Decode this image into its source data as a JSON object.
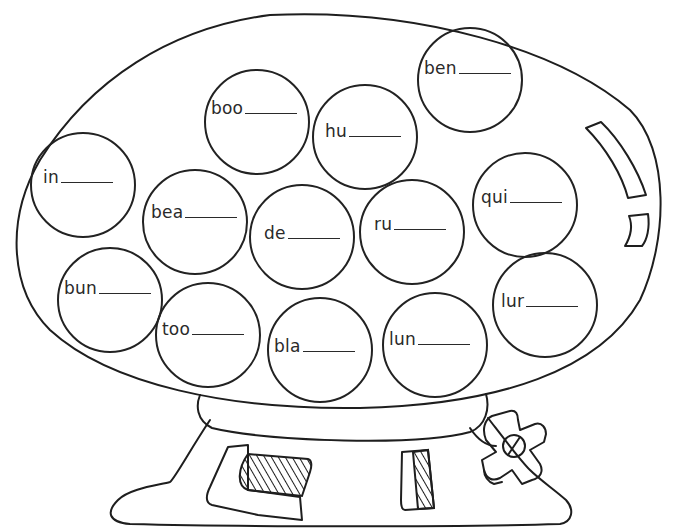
{
  "worksheet": {
    "header_partial": "",
    "illustration": "gumball machine",
    "blank_marker": "_____",
    "bubbles": [
      {
        "id": "in",
        "prefix": "in",
        "cx": 83,
        "cy": 185,
        "tx": -40,
        "ty": -8
      },
      {
        "id": "boo",
        "prefix": "boo",
        "cx": 257,
        "cy": 122,
        "tx": -46,
        "ty": -14
      },
      {
        "id": "hu",
        "prefix": "hu",
        "cx": 365,
        "cy": 137,
        "tx": -40,
        "ty": -6
      },
      {
        "id": "ben",
        "prefix": "ben",
        "cx": 470,
        "cy": 80,
        "tx": -46,
        "ty": -12
      },
      {
        "id": "qui",
        "prefix": "qui",
        "cx": 525,
        "cy": 205,
        "tx": -44,
        "ty": -8
      },
      {
        "id": "bea",
        "prefix": "bea",
        "cx": 195,
        "cy": 222,
        "tx": -44,
        "ty": -10
      },
      {
        "id": "de",
        "prefix": "de",
        "cx": 302,
        "cy": 237,
        "tx": -38,
        "ty": -4
      },
      {
        "id": "ru",
        "prefix": "ru",
        "cx": 412,
        "cy": 232,
        "tx": -38,
        "ty": -8
      },
      {
        "id": "bun",
        "prefix": "bun",
        "cx": 110,
        "cy": 300,
        "tx": -46,
        "ty": -12
      },
      {
        "id": "too",
        "prefix": "too",
        "cx": 208,
        "cy": 335,
        "tx": -46,
        "ty": -6
      },
      {
        "id": "bla",
        "prefix": "bla",
        "cx": 320,
        "cy": 350,
        "tx": -46,
        "ty": -4
      },
      {
        "id": "lun",
        "prefix": "lun",
        "cx": 435,
        "cy": 345,
        "tx": -46,
        "ty": -6
      },
      {
        "id": "lur",
        "prefix": "lur",
        "cx": 545,
        "cy": 305,
        "tx": -44,
        "ty": -4
      }
    ]
  }
}
